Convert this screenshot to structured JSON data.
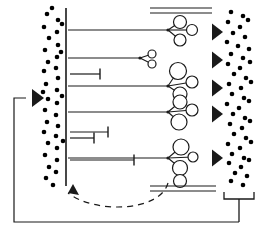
{
  "figure": {
    "type": "schematic-diagram",
    "title": "",
    "background_color": "#ffffff",
    "stroke_color": "#1a1a1a",
    "particle_color": "#000000",
    "width": 264,
    "height": 242
  },
  "left_particle_field": {
    "name": "left-particle-field",
    "description": "scattered filled dots at left of vertical barrier",
    "dot_radius": 2.3,
    "dots": [
      [
        47,
        14
      ],
      [
        58,
        20
      ],
      [
        44,
        27
      ],
      [
        57,
        32
      ],
      [
        49,
        38
      ],
      [
        58,
        45
      ],
      [
        45,
        50
      ],
      [
        57,
        57
      ],
      [
        48,
        62
      ],
      [
        44,
        71
      ],
      [
        56,
        68
      ],
      [
        58,
        78
      ],
      [
        46,
        84
      ],
      [
        43,
        92
      ],
      [
        57,
        90
      ],
      [
        48,
        99
      ],
      [
        57,
        103
      ],
      [
        45,
        110
      ],
      [
        56,
        115
      ],
      [
        47,
        122
      ],
      [
        58,
        126
      ],
      [
        44,
        132
      ],
      [
        56,
        136
      ],
      [
        48,
        143
      ],
      [
        57,
        148
      ],
      [
        45,
        155
      ],
      [
        57,
        160
      ],
      [
        49,
        167
      ],
      [
        56,
        172
      ],
      [
        46,
        178
      ],
      [
        62,
        24
      ],
      [
        61,
        52
      ],
      [
        62,
        96
      ],
      [
        63,
        141
      ],
      [
        52,
        8
      ],
      [
        53,
        185
      ]
    ]
  },
  "right_particle_field": {
    "name": "right-particle-field",
    "description": "scattered filled dots at right, product side",
    "dot_radius": 2.3,
    "dots": [
      [
        231,
        12
      ],
      [
        243,
        16
      ],
      [
        228,
        22
      ],
      [
        240,
        27
      ],
      [
        248,
        20
      ],
      [
        233,
        33
      ],
      [
        245,
        37
      ],
      [
        227,
        42
      ],
      [
        238,
        46
      ],
      [
        249,
        49
      ],
      [
        231,
        54
      ],
      [
        243,
        58
      ],
      [
        228,
        64
      ],
      [
        240,
        68
      ],
      [
        250,
        62
      ],
      [
        234,
        74
      ],
      [
        246,
        78
      ],
      [
        229,
        84
      ],
      [
        241,
        88
      ],
      [
        251,
        82
      ],
      [
        232,
        94
      ],
      [
        244,
        98
      ],
      [
        227,
        104
      ],
      [
        239,
        108
      ],
      [
        249,
        101
      ],
      [
        233,
        114
      ],
      [
        245,
        118
      ],
      [
        230,
        124
      ],
      [
        242,
        128
      ],
      [
        250,
        121
      ],
      [
        234,
        134
      ],
      [
        246,
        138
      ],
      [
        228,
        144
      ],
      [
        240,
        148
      ],
      [
        251,
        142
      ],
      [
        232,
        154
      ],
      [
        244,
        158
      ],
      [
        229,
        163
      ],
      [
        241,
        167
      ],
      [
        249,
        160
      ],
      [
        235,
        173
      ],
      [
        247,
        176
      ],
      [
        231,
        181
      ],
      [
        243,
        185
      ]
    ]
  },
  "barrier": {
    "name": "vertical-membrane-barrier",
    "x": 66,
    "y_top": 8,
    "y_bottom": 186,
    "stroke_width": 1.6
  },
  "inlet_arrow": {
    "name": "inlet-arrow",
    "label": "",
    "x": 32,
    "y": 98,
    "direction": "right"
  },
  "feedback_path": {
    "name": "feedback-recycle-path",
    "style": "solid-then-dashed",
    "enters_at": [
      32,
      98
    ],
    "left_riser_x": 14,
    "bottom_y": 200
  },
  "channels": [
    {
      "name": "channel-1",
      "y": 30,
      "x_start": 68,
      "x_end": 168,
      "type": "full",
      "node_cluster": "cluster-1"
    },
    {
      "name": "channel-2",
      "y": 58,
      "x_start": 68,
      "x_end": 140,
      "type": "full",
      "node_cluster": "cluster-2"
    },
    {
      "name": "channel-3",
      "y": 74,
      "x_start": 70,
      "x_end": 100,
      "type": "capped",
      "node_cluster": null
    },
    {
      "name": "channel-4",
      "y": 86,
      "x_start": 68,
      "x_end": 168,
      "type": "full",
      "node_cluster": "cluster-3"
    },
    {
      "name": "channel-5",
      "y": 112,
      "x_start": 68,
      "x_end": 168,
      "type": "full",
      "node_cluster": "cluster-4"
    },
    {
      "name": "channel-6",
      "y": 132,
      "x_start": 70,
      "x_end": 108,
      "type": "capped",
      "node_cluster": null
    },
    {
      "name": "channel-7",
      "y": 138,
      "x_start": 70,
      "x_end": 94,
      "type": "capped",
      "node_cluster": null
    },
    {
      "name": "channel-8",
      "y": 160,
      "x_start": 70,
      "x_end": 134,
      "type": "capped",
      "node_cluster": null
    },
    {
      "name": "channel-9",
      "y": 158,
      "x_start": 68,
      "x_end": 168,
      "type": "full",
      "node_cluster": "cluster-5"
    }
  ],
  "node_clusters": [
    {
      "name": "cluster-1",
      "hub": [
        168,
        30
      ],
      "nodes": [
        [
          180,
          22,
          6.5
        ],
        [
          192,
          30,
          5.5
        ],
        [
          180,
          40,
          6.0
        ]
      ]
    },
    {
      "name": "cluster-2",
      "hub": [
        140,
        58
      ],
      "nodes": [
        [
          152,
          54,
          4.0
        ],
        [
          152,
          64,
          4.0
        ]
      ]
    },
    {
      "name": "cluster-3",
      "hub": [
        168,
        86
      ],
      "nodes": [
        [
          178,
          71,
          8.5
        ],
        [
          192,
          82,
          6.0
        ],
        [
          180,
          94,
          7.0
        ]
      ]
    },
    {
      "name": "cluster-4",
      "hub": [
        168,
        112
      ],
      "nodes": [
        [
          180,
          102,
          7.0
        ],
        [
          192,
          110,
          6.0
        ],
        [
          179,
          122,
          8.0
        ]
      ]
    },
    {
      "name": "cluster-5",
      "hub": [
        168,
        158
      ],
      "nodes": [
        [
          181,
          147,
          8.0
        ],
        [
          193,
          157,
          5.0
        ],
        [
          180,
          168,
          7.5
        ]
      ]
    }
  ],
  "outlet_arrows": {
    "name": "outlet-arrows",
    "x": 212,
    "positions_y": [
      32,
      60,
      88,
      114,
      158
    ],
    "direction": "right"
  },
  "top_double_line": {
    "name": "top-boundary-double-line",
    "x_start": 150,
    "x_end": 212,
    "y1": 8,
    "y2": 13
  },
  "bottom_double_line": {
    "name": "bottom-boundary-double-line",
    "x_start": 150,
    "x_end": 216,
    "y1": 186,
    "y2": 191
  },
  "bottom_circle": {
    "name": "bottom-boundary-circle",
    "cx": 180,
    "cy": 181,
    "r": 6.5
  },
  "collector_bracket": {
    "name": "product-collector-bracket",
    "x_left": 224,
    "x_right": 254,
    "y_top": 192,
    "y_bottom": 199,
    "stem_x": 239,
    "stem_y_end": 222
  },
  "legend": {
    "items": []
  }
}
